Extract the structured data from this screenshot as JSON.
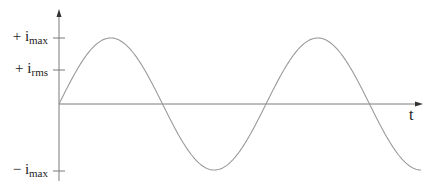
{
  "figure": {
    "type": "sinusoidal AC current waveform",
    "x_axis_label": "t",
    "y_labels": {
      "imax_pos": {
        "sign": "+ ",
        "base": "i",
        "sub": "max"
      },
      "irms_pos": {
        "sign": "+ ",
        "base": "i",
        "sub": "rms"
      },
      "imax_neg": {
        "sign": "− ",
        "base": "i",
        "sub": "max"
      }
    },
    "colors": {
      "axis": "#7a7a7a",
      "curve": "#9a9a9a",
      "text": "#222222"
    },
    "geometry": {
      "origin_x": 59,
      "origin_y": 104,
      "amplitude_px": 66,
      "period_px": 207,
      "curve_end_x": 421,
      "y_axis_top": 12,
      "y_axis_bottom": 181,
      "x_axis_end": 422,
      "ticks_y": [
        38,
        70,
        171
      ]
    }
  }
}
